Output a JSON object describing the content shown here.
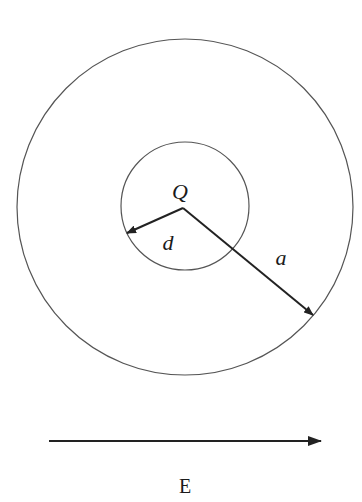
{
  "diagram": {
    "type": "physics-electrostatics",
    "outer_circle": {
      "cx": 185,
      "cy": 207,
      "r": 168,
      "stroke": "#555555"
    },
    "inner_circle": {
      "cx": 185,
      "cy": 206,
      "r": 64,
      "stroke": "#555555"
    },
    "charge": {
      "label": "Q",
      "x": 183,
      "y": 208
    },
    "vectors": [
      {
        "name": "d",
        "label": "d",
        "from": [
          183,
          208
        ],
        "to": [
          127,
          233
        ]
      },
      {
        "name": "a",
        "label": "a",
        "from": [
          183,
          208
        ],
        "to": [
          313,
          315
        ]
      }
    ],
    "field": {
      "label": "E",
      "from": [
        49,
        441
      ],
      "to": [
        321,
        441
      ],
      "direction": "right"
    },
    "colors": {
      "line": "#222222",
      "circle": "#555555",
      "background": "#ffffff"
    }
  },
  "labels": {
    "charge": "Q",
    "inner_radius": "d",
    "outer_radius": "a",
    "field": "E"
  }
}
